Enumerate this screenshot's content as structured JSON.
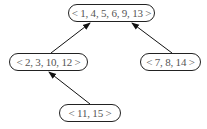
{
  "diagram": {
    "type": "tree",
    "nodes": [
      {
        "id": "root",
        "label": "< 1, 4, 5, 6, 9, 13 >"
      },
      {
        "id": "left",
        "label": "< 2, 3, 10, 12 >"
      },
      {
        "id": "right",
        "label": "< 7, 8, 14 >"
      },
      {
        "id": "bottom",
        "label": "< 11, 15 >"
      }
    ],
    "edges": [
      {
        "from": "left",
        "to": "root"
      },
      {
        "from": "right",
        "to": "root"
      },
      {
        "from": "bottom",
        "to": "left"
      }
    ]
  }
}
